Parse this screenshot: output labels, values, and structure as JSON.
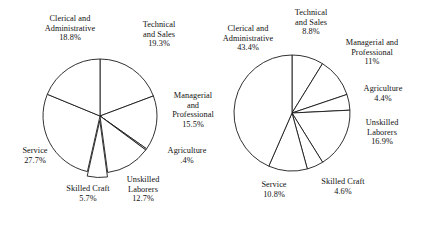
{
  "figure": {
    "background_color": "#ffffff",
    "line_color": "#1a1a1a",
    "text_color": "#111111"
  },
  "chart_data": [
    {
      "type": "pie",
      "name": "left-pie",
      "title": "",
      "start_angle_deg": 0,
      "direction": "clockwise",
      "center": [
        100,
        116
      ],
      "radius": 57,
      "exploded_slices": [
        "Skilled Craft"
      ],
      "categories": [
        "Technical and Sales",
        "Managerial and Professional",
        "Agriculture",
        "Unskilled Laborers",
        "Skilled Craft",
        "Service",
        "Clerical and Administrative"
      ],
      "values": [
        19.3,
        15.5,
        0.4,
        12.7,
        5.7,
        27.7,
        18.8
      ],
      "labels": [
        {
          "lines": [
            "Technical",
            "and Sales"
          ],
          "pct": "19.3%"
        },
        {
          "lines": [
            "Managerial",
            "and",
            "Professional"
          ],
          "pct": "15.5%"
        },
        {
          "lines": [
            "Agriculture"
          ],
          "pct": ".4%"
        },
        {
          "lines": [
            "Unskilled",
            "Laborers"
          ],
          "pct": "12.7%"
        },
        {
          "lines": [
            "Skilled Craft"
          ],
          "pct": "5.7%"
        },
        {
          "lines": [
            "Service"
          ],
          "pct": "27.7%"
        },
        {
          "lines": [
            "Clerical and",
            "Administrative"
          ],
          "pct": "18.8%"
        }
      ]
    },
    {
      "type": "pie",
      "name": "right-pie",
      "title": "",
      "start_angle_deg": 0,
      "direction": "clockwise",
      "center": [
        292,
        113
      ],
      "radius": 58,
      "exploded_slices": [],
      "categories": [
        "Technical and Sales",
        "Managerial and Professional",
        "Agriculture",
        "Unskilled Laborers",
        "Skilled Craft",
        "Service",
        "Clerical and Administrative"
      ],
      "values": [
        8.8,
        11.0,
        4.4,
        16.9,
        4.6,
        10.8,
        43.4
      ],
      "labels": [
        {
          "lines": [
            "Technical",
            "and Sales"
          ],
          "pct": "8.8%"
        },
        {
          "lines": [
            "Managerial and",
            "Professional"
          ],
          "pct": "11%"
        },
        {
          "lines": [
            "Agriculture"
          ],
          "pct": "4.4%"
        },
        {
          "lines": [
            "Unskilled",
            "Laborers"
          ],
          "pct": "16.9%"
        },
        {
          "lines": [
            "Skilled Craft"
          ],
          "pct": "4.6%"
        },
        {
          "lines": [
            "Service"
          ],
          "pct": "10.8%"
        },
        {
          "lines": [
            "Clerical and",
            "Administrative"
          ],
          "pct": "43.4%"
        }
      ]
    }
  ],
  "left_chart_labels": {
    "clerical": {
      "l1": "Clerical and",
      "l2": "Administrative",
      "pct": "18.8%"
    },
    "technical": {
      "l1": "Technical",
      "l2": "and Sales",
      "pct": "19.3%"
    },
    "managerial": {
      "l1": "Managerial",
      "l2": "and",
      "l3": "Professional",
      "pct": "15.5%"
    },
    "agriculture": {
      "l1": "Agriculture",
      "pct": ".4%"
    },
    "unskilled": {
      "l1": "Unskilled",
      "l2": "Laborers",
      "pct": "12.7%"
    },
    "skilled": {
      "l1": "Skilled Craft",
      "pct": "5.7%"
    },
    "service": {
      "l1": "Service",
      "pct": "27.7%"
    }
  },
  "right_chart_labels": {
    "clerical": {
      "l1": "Clerical and",
      "l2": "Administrative",
      "pct": "43.4%"
    },
    "technical": {
      "l1": "Technical",
      "l2": "and Sales",
      "pct": "8.8%"
    },
    "managerial": {
      "l1": "Managerial and",
      "l2": "Professional",
      "pct": "11%"
    },
    "agriculture": {
      "l1": "Agriculture",
      "pct": "4.4%"
    },
    "unskilled": {
      "l1": "Unskilled",
      "l2": "Laborers",
      "pct": "16.9%"
    },
    "skilled": {
      "l1": "Skilled Craft",
      "pct": "4.6%"
    },
    "service": {
      "l1": "Service",
      "pct": "10.8%"
    }
  }
}
